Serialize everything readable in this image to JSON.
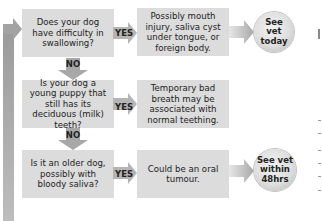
{
  "flowchart": {
    "rows": [
      {
        "question": "Does your dog have difficulty in swallowing?",
        "yes_label": "YES",
        "result": "Possibly mouth injury, saliva cyst under tongue, or foreign body.",
        "action": "See vet today"
      },
      {
        "question": "Is your dog a young puppy that still has its deciduous (milk) teeth?",
        "yes_label": "YES",
        "result": "Temporary bad breath may be associated with normal teething.",
        "action": null
      },
      {
        "question": "Is it an older dog, possibly with bloody saliva?",
        "yes_label": "YES",
        "result": "Could be an oral tumour.",
        "action": "See vet within 48hrs"
      }
    ],
    "no_labels": [
      "NO",
      "NO"
    ]
  },
  "colors": {
    "box": "#dcdcdc",
    "arrow": "#a6a6a6",
    "text": "#222222"
  }
}
